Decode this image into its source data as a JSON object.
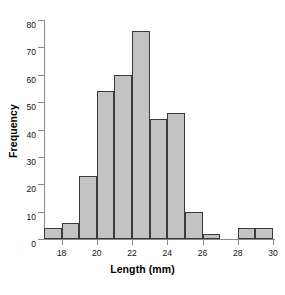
{
  "chart_data": {
    "type": "bar",
    "title": "",
    "subtitle": "",
    "xlabel": "Length (mm)",
    "ylabel": "Frequency",
    "xlim": [
      17,
      30
    ],
    "ylim": [
      0,
      80
    ],
    "bin_width": 1,
    "grid": false,
    "legend": null,
    "bar_color": "#c3c3c3",
    "bar_edge_color": "#3a3a3a",
    "axis_color": "#8a8a8a",
    "xticks": [
      18,
      20,
      22,
      24,
      26,
      28,
      30
    ],
    "xtick_labels": [
      "18",
      "20",
      "22",
      "24",
      "26",
      "28",
      "30"
    ],
    "yticks": [
      0,
      10,
      20,
      30,
      40,
      50,
      60,
      70,
      80
    ],
    "ytick_labels": [
      "0",
      "10",
      "20",
      "30",
      "40",
      "50",
      "60",
      "70",
      "80"
    ],
    "bins": [
      {
        "start": 17,
        "end": 18,
        "value": 4
      },
      {
        "start": 18,
        "end": 19,
        "value": 6
      },
      {
        "start": 19,
        "end": 20,
        "value": 23
      },
      {
        "start": 20,
        "end": 21,
        "value": 54
      },
      {
        "start": 21,
        "end": 22,
        "value": 60
      },
      {
        "start": 22,
        "end": 23,
        "value": 76
      },
      {
        "start": 23,
        "end": 24,
        "value": 44
      },
      {
        "start": 24,
        "end": 25,
        "value": 46
      },
      {
        "start": 25,
        "end": 26,
        "value": 10
      },
      {
        "start": 26,
        "end": 27,
        "value": 2
      },
      {
        "start": 27,
        "end": 28,
        "value": 0
      },
      {
        "start": 28,
        "end": 29,
        "value": 4
      },
      {
        "start": 29,
        "end": 30,
        "value": 4
      }
    ],
    "categories": [
      "17-18",
      "18-19",
      "19-20",
      "20-21",
      "21-22",
      "22-23",
      "23-24",
      "24-25",
      "25-26",
      "26-27",
      "27-28",
      "28-29",
      "29-30"
    ],
    "values": [
      4,
      6,
      23,
      54,
      60,
      76,
      44,
      46,
      10,
      2,
      0,
      4,
      4
    ]
  }
}
